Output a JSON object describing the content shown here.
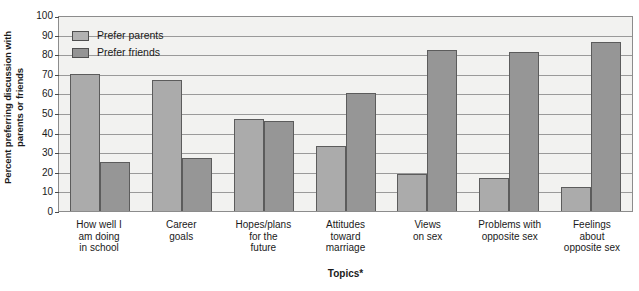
{
  "chart_data": {
    "type": "bar",
    "title": "",
    "xlabel": "Topics*",
    "ylabel": "Percent preferring discussion with parents or friends",
    "ylabel_lines": [
      "Percent preferring discussion with",
      "parents or friends"
    ],
    "ylim": [
      0,
      100
    ],
    "yticks": [
      0,
      10,
      20,
      30,
      40,
      50,
      60,
      70,
      80,
      90,
      100
    ],
    "grid": true,
    "legend_position": "top-left",
    "categories": [
      "How well I am doing in school",
      "Career goals",
      "Hopes/plans for the future",
      "Attitudes toward marriage",
      "Views on sex",
      "Problems with opposite sex",
      "Feelings about opposite sex"
    ],
    "category_lines": [
      [
        "How well I",
        "am doing",
        "in school"
      ],
      [
        "Career",
        "goals"
      ],
      [
        "Hopes/plans",
        "for the",
        "future"
      ],
      [
        "Attitudes",
        "toward",
        "marriage"
      ],
      [
        "Views",
        "on sex"
      ],
      [
        "Problems with",
        "opposite sex"
      ],
      [
        "Feelings",
        "about",
        "opposite sex"
      ]
    ],
    "series": [
      {
        "name": "Prefer parents",
        "color": "#ababab",
        "values": [
          70,
          67,
          47,
          33,
          19,
          17,
          12
        ]
      },
      {
        "name": "Prefer friends",
        "color": "#969696",
        "values": [
          25,
          27,
          46,
          60,
          82,
          81,
          86
        ]
      }
    ]
  },
  "legend": {
    "items": [
      {
        "label": "Prefer parents",
        "swatch": "parents"
      },
      {
        "label": "Prefer friends",
        "swatch": "friends"
      }
    ]
  },
  "colors": {
    "plot_background": "#f2f2f0",
    "gridline": "#9a9a9a",
    "axis": "#8c8c8c",
    "bar_border": "#5c5c5c",
    "series_parents": "#ababab",
    "series_friends": "#969696"
  }
}
